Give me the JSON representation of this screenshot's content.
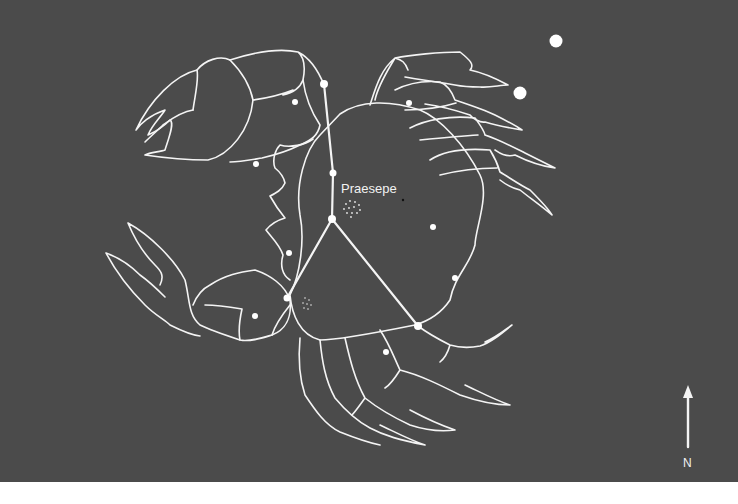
{
  "figure": {
    "colors": {
      "background": "#4b4b4b",
      "lines": "#f4f4f4",
      "page": "#ffffff"
    }
  },
  "labels": {
    "cluster": "Praesepe",
    "compass": "N"
  },
  "stars": [
    {
      "x": 324,
      "y": 84,
      "r": 4
    },
    {
      "x": 295,
      "y": 102,
      "r": 3
    },
    {
      "x": 409,
      "y": 103,
      "r": 3
    },
    {
      "x": 256,
      "y": 164,
      "r": 3
    },
    {
      "x": 333,
      "y": 173,
      "r": 3.5
    },
    {
      "x": 332,
      "y": 219,
      "r": 4
    },
    {
      "x": 433,
      "y": 227,
      "r": 3
    },
    {
      "x": 289,
      "y": 253,
      "r": 3
    },
    {
      "x": 455,
      "y": 278,
      "r": 3
    },
    {
      "x": 287,
      "y": 298,
      "r": 3.5
    },
    {
      "x": 255,
      "y": 316,
      "r": 3
    },
    {
      "x": 418,
      "y": 326,
      "r": 4
    },
    {
      "x": 386,
      "y": 352,
      "r": 3
    },
    {
      "x": 556,
      "y": 41,
      "r": 6.5
    },
    {
      "x": 520,
      "y": 93,
      "r": 6.5
    }
  ]
}
